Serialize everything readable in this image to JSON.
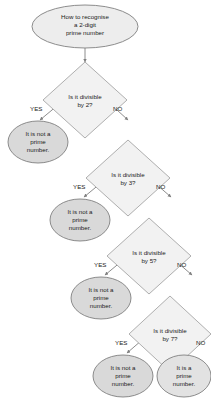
{
  "diagram": {
    "colors": {
      "terminal_fill": "#d9d9d9",
      "decision_fill": "#f2f2f2",
      "stroke": "#808080",
      "connector": "#808080",
      "text": "#1a1a1a",
      "background": "#ffffff"
    },
    "start": {
      "id": "start",
      "shape": "ellipse",
      "text": "How to recognise\na 2-digit\nprime number"
    },
    "decisions": [
      {
        "id": "div2",
        "shape": "diamond",
        "text": "Is it divisible\nby 2?",
        "yes_label": "YES",
        "no_label": "NO"
      },
      {
        "id": "div3",
        "shape": "diamond",
        "text": "Is it divisible\nby 3?",
        "yes_label": "YES",
        "no_label": "NO"
      },
      {
        "id": "div5",
        "shape": "diamond",
        "text": "Is it divisible\nby 5?",
        "yes_label": "YES",
        "no_label": "NO"
      },
      {
        "id": "div7",
        "shape": "diamond",
        "text": "Is it divisible\nby 7?",
        "yes_label": "YES",
        "no_label": "NO"
      }
    ],
    "outcomes": [
      {
        "id": "not-prime-1",
        "shape": "ellipse",
        "text": "It is not a\nprime\nnumber."
      },
      {
        "id": "not-prime-2",
        "shape": "ellipse",
        "text": "It is not a\nprime\nnumber."
      },
      {
        "id": "not-prime-3",
        "shape": "ellipse",
        "text": "It is not a\nprime\nnumber."
      },
      {
        "id": "not-prime-4",
        "shape": "ellipse",
        "text": "It is not a\nprime\nnumber."
      },
      {
        "id": "prime",
        "shape": "ellipse",
        "text": "It is a\nprime\nnumber."
      }
    ]
  }
}
